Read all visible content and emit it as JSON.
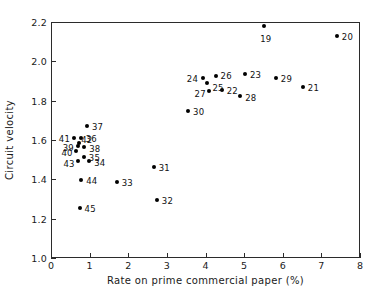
{
  "chart_data": {
    "type": "scatter",
    "title": "",
    "xlabel": "Rate on prime commercial paper (%)",
    "ylabel": "Circuit velocity",
    "xlim": [
      0,
      8
    ],
    "ylim": [
      1.0,
      2.2
    ],
    "xticks": [
      "0",
      "1",
      "2",
      "3",
      "4",
      "5",
      "6",
      "7",
      "8"
    ],
    "xtick_values": [
      0,
      1,
      2,
      3,
      4,
      5,
      6,
      7,
      8
    ],
    "yticks": [
      "1.0",
      "1.2",
      "1.4",
      "1.6",
      "1.8",
      "2.0",
      "2.2"
    ],
    "ytick_values": [
      1.0,
      1.2,
      1.4,
      1.6,
      1.8,
      2.0,
      2.2
    ],
    "grid": false,
    "legend": null,
    "marker": "filled-circle",
    "marker_color": "#000000",
    "points": [
      {
        "label": "19",
        "x": 5.52,
        "y": 2.182,
        "label_dx": -4,
        "label_dy": 8
      },
      {
        "label": "20",
        "x": 7.4,
        "y": 2.128,
        "label_dx": 5,
        "label_dy": -4
      },
      {
        "label": "21",
        "x": 6.52,
        "y": 1.868,
        "label_dx": 5,
        "label_dy": -4
      },
      {
        "label": "22",
        "x": 4.42,
        "y": 1.852,
        "label_dx": 5,
        "label_dy": -4
      },
      {
        "label": "23",
        "x": 5.02,
        "y": 1.934,
        "label_dx": 5,
        "label_dy": -4
      },
      {
        "label": "24",
        "x": 3.93,
        "y": 1.913,
        "label_dx": -16,
        "label_dy": -4
      },
      {
        "label": "25",
        "x": 4.05,
        "y": 1.89,
        "label_dx": 5,
        "label_dy": 0
      },
      {
        "label": "26",
        "x": 4.26,
        "y": 1.923,
        "label_dx": 5,
        "label_dy": -5
      },
      {
        "label": "27",
        "x": 4.08,
        "y": 1.85,
        "label_dx": -14,
        "label_dy": -2
      },
      {
        "label": "28",
        "x": 4.9,
        "y": 1.822,
        "label_dx": 5,
        "label_dy": -3
      },
      {
        "label": "29",
        "x": 5.82,
        "y": 1.913,
        "label_dx": 5,
        "label_dy": -4
      },
      {
        "label": "30",
        "x": 3.55,
        "y": 1.748,
        "label_dx": 5,
        "label_dy": -4
      },
      {
        "label": "31",
        "x": 2.66,
        "y": 1.465,
        "label_dx": 5,
        "label_dy": -4
      },
      {
        "label": "32",
        "x": 2.74,
        "y": 1.295,
        "label_dx": 5,
        "label_dy": -4
      },
      {
        "label": "33",
        "x": 1.7,
        "y": 1.385,
        "label_dx": 5,
        "label_dy": -4
      },
      {
        "label": "34",
        "x": 0.99,
        "y": 1.492,
        "label_dx": 5,
        "label_dy": -3
      },
      {
        "label": "35",
        "x": 0.85,
        "y": 1.512,
        "label_dx": 5,
        "label_dy": -4
      },
      {
        "label": "36",
        "x": 0.77,
        "y": 1.608,
        "label_dx": 5,
        "label_dy": -4
      },
      {
        "label": "37",
        "x": 0.93,
        "y": 1.67,
        "label_dx": 5,
        "label_dy": -4
      },
      {
        "label": "38",
        "x": 0.86,
        "y": 1.562,
        "label_dx": 5,
        "label_dy": -3
      },
      {
        "label": "39",
        "x": 0.69,
        "y": 1.57,
        "label_dx": -15,
        "label_dy": -3
      },
      {
        "label": "40",
        "x": 0.66,
        "y": 1.545,
        "label_dx": -15,
        "label_dy": -3
      },
      {
        "label": "41",
        "x": 0.59,
        "y": 1.612,
        "label_dx": -15,
        "label_dy": -4
      },
      {
        "label": "42",
        "x": 0.73,
        "y": 1.585,
        "label_dx": 2,
        "label_dy": -8
      },
      {
        "label": "43",
        "x": 0.71,
        "y": 1.492,
        "label_dx": -15,
        "label_dy": -2
      },
      {
        "label": "44",
        "x": 0.78,
        "y": 1.395,
        "label_dx": 5,
        "label_dy": -4
      },
      {
        "label": "45",
        "x": 0.74,
        "y": 1.255,
        "label_dx": 5,
        "label_dy": -4
      }
    ]
  }
}
